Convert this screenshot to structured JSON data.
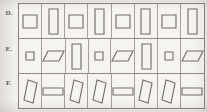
{
  "sheet": {
    "background_color": "#f2f0ec",
    "grid_line_color": "#908b88",
    "figure_stroke_color": "#6f6b68",
    "figure_fill_color": "#f6f4f1",
    "columns": 8,
    "rows": 3
  },
  "rows": [
    {
      "label": "D.",
      "name": "row-d",
      "cells": [
        {
          "shape": "square",
          "name": "square-figure"
        },
        {
          "shape": "tall-rectangle",
          "name": "tall-rectangle-figure"
        },
        {
          "shape": "square",
          "name": "square-figure"
        },
        {
          "shape": "tall-rectangle",
          "name": "tall-rectangle-figure"
        },
        {
          "shape": "square",
          "name": "square-figure"
        },
        {
          "shape": "tall-rectangle",
          "name": "tall-rectangle-figure"
        },
        {
          "shape": "square",
          "name": "square-figure"
        },
        {
          "shape": "tall-rectangle",
          "name": "tall-rectangle-figure"
        }
      ]
    },
    {
      "label": "E.",
      "name": "row-e",
      "cells": [
        {
          "shape": "small-square",
          "name": "small-square-figure"
        },
        {
          "shape": "parallelogram-flat",
          "name": "flat-parallelogram-figure"
        },
        {
          "shape": "tall-rectangle",
          "name": "tall-rectangle-figure"
        },
        {
          "shape": "small-square",
          "name": "small-square-figure"
        },
        {
          "shape": "parallelogram-flat",
          "name": "flat-parallelogram-figure"
        },
        {
          "shape": "tall-rectangle",
          "name": "tall-rectangle-figure"
        },
        {
          "shape": "small-square",
          "name": "small-square-figure"
        },
        {
          "shape": "parallelogram-flat",
          "name": "flat-parallelogram-figure"
        }
      ]
    },
    {
      "label": "F.",
      "name": "row-f",
      "cells": [
        {
          "shape": "parallelogram-tall",
          "name": "tall-parallelogram-figure"
        },
        {
          "shape": "wide-rectangle",
          "name": "wide-rectangle-figure"
        },
        {
          "shape": "parallelogram-tall",
          "name": "tall-parallelogram-figure"
        },
        {
          "shape": "parallelogram-tall",
          "name": "tall-parallelogram-figure"
        },
        {
          "shape": "wide-rectangle",
          "name": "wide-rectangle-figure"
        },
        {
          "shape": "parallelogram-tall",
          "name": "tall-parallelogram-figure"
        },
        {
          "shape": "parallelogram-tall",
          "name": "tall-parallelogram-figure"
        },
        {
          "shape": "wide-rectangle",
          "name": "wide-rectangle-figure"
        }
      ]
    }
  ]
}
